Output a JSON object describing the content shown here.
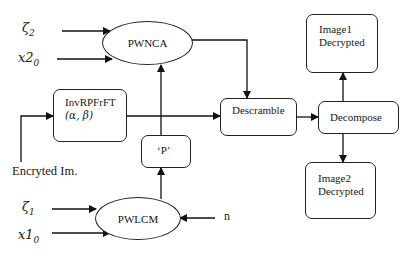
{
  "diagram": {
    "inputs": {
      "zeta2": {
        "symbol": "ζ",
        "sub": "2"
      },
      "x20": {
        "symbol": "x2",
        "sub": "0"
      },
      "zeta1": {
        "symbol": "ζ",
        "sub": "1"
      },
      "x10": {
        "symbol": "x1",
        "sub": "0"
      },
      "n": "n",
      "encrypted_image": "Encryted Im."
    },
    "nodes": {
      "pwnca": "PWNCA",
      "pwlcm": "PWLCM",
      "invrpfrft_line1": "InvRPFrFT",
      "invrpfrft_line2": "(α, β)",
      "p": "‘P’",
      "descramble": "Descramble",
      "decompose": "Decompose",
      "image1_line1": "Image1",
      "image1_line2": "Decrypted",
      "image2_line1": "Image2",
      "image2_line2": "Decrypted"
    },
    "edges": [
      {
        "from": "ζ2",
        "to": "PWNCA"
      },
      {
        "from": "x2_0",
        "to": "PWNCA"
      },
      {
        "from": "PWNCA",
        "to": "Descramble"
      },
      {
        "from": "Encryted Im.",
        "to": "InvRPFrFT"
      },
      {
        "from": "InvRPFrFT",
        "to": "Descramble"
      },
      {
        "from": "'P'",
        "to": "PWNCA"
      },
      {
        "from": "PWLCM",
        "to": "'P'"
      },
      {
        "from": "ζ1",
        "to": "PWLCM"
      },
      {
        "from": "x1_0",
        "to": "PWLCM"
      },
      {
        "from": "n",
        "to": "PWLCM"
      },
      {
        "from": "Descramble",
        "to": "Decompose"
      },
      {
        "from": "Decompose",
        "to": "Image1 Decrypted"
      },
      {
        "from": "Decompose",
        "to": "Image2 Decrypted"
      }
    ]
  }
}
